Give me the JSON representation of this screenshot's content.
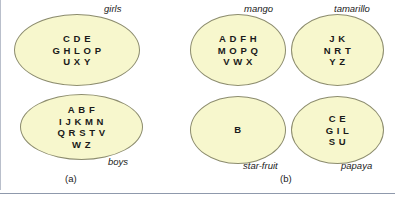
{
  "figure": {
    "panels": [
      {
        "caption": "(a)",
        "sets": [
          {
            "label": "girls",
            "label_position": "top-right",
            "rows": [
              [
                "C",
                "D",
                "E"
              ],
              [
                "G",
                "H",
                "L",
                "O",
                "P"
              ],
              [
                "U",
                "X",
                "Y"
              ]
            ],
            "members": [
              "C",
              "D",
              "E",
              "G",
              "H",
              "L",
              "O",
              "P",
              "U",
              "X",
              "Y"
            ]
          },
          {
            "label": "boys",
            "label_position": "bottom-right",
            "rows": [
              [
                "A",
                "B",
                "F"
              ],
              [
                "I",
                "J",
                "K",
                "M",
                "N"
              ],
              [
                "Q",
                "R",
                "S",
                "T",
                "V"
              ],
              [
                "W",
                "Z"
              ]
            ],
            "members": [
              "A",
              "B",
              "F",
              "I",
              "J",
              "K",
              "M",
              "N",
              "Q",
              "R",
              "S",
              "T",
              "V",
              "W",
              "Z"
            ]
          }
        ]
      },
      {
        "caption": "(b)",
        "sets": [
          {
            "label": "mango",
            "label_position": "top-right",
            "rows": [
              [
                "A",
                "D",
                "F",
                "H"
              ],
              [
                "M",
                "O",
                "P",
                "Q"
              ],
              [
                "V",
                "W",
                "X"
              ]
            ],
            "members": [
              "A",
              "D",
              "F",
              "H",
              "M",
              "O",
              "P",
              "Q",
              "V",
              "W",
              "X"
            ]
          },
          {
            "label": "tamarillo",
            "label_position": "top-right",
            "rows": [
              [
                "J",
                "K"
              ],
              [
                "N",
                "R",
                "T"
              ],
              [
                "Y",
                "Z"
              ]
            ],
            "members": [
              "J",
              "K",
              "N",
              "R",
              "T",
              "Y",
              "Z"
            ]
          },
          {
            "label": "star-fruit",
            "label_position": "bottom-right",
            "rows": [
              [
                "B"
              ]
            ],
            "members": [
              "B"
            ]
          },
          {
            "label": "papaya",
            "label_position": "bottom-right",
            "rows": [
              [
                "C",
                "E"
              ],
              [
                "G",
                "I",
                "L"
              ],
              [
                "S",
                "U"
              ]
            ],
            "members": [
              "C",
              "E",
              "G",
              "I",
              "L",
              "S",
              "U"
            ]
          }
        ]
      }
    ],
    "colors": {
      "ellipse_fill": "#f7f7cd",
      "ellipse_stroke": "#8c8c6e",
      "text": "#1a1a1a",
      "rule": "#8f99ac",
      "background": "#ffffff"
    }
  }
}
